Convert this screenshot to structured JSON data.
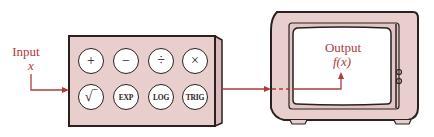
{
  "diagram": {
    "colors": {
      "box_fill": "#e8cfcd",
      "outline": "#2a2020",
      "arrow": "#b03a3a",
      "label": "#b03a3a",
      "screen": "#ffffff"
    },
    "input": {
      "label": "Input",
      "variable": "x"
    },
    "calculator": {
      "buttons": [
        {
          "label": "+",
          "icon": "plus-icon"
        },
        {
          "label": "−",
          "icon": "minus-icon"
        },
        {
          "label": "÷",
          "icon": "divide-icon"
        },
        {
          "label": "×",
          "icon": "multiply-icon"
        },
        {
          "label": "√‾",
          "icon": "square-root-icon"
        },
        {
          "label": "EXP"
        },
        {
          "label": "LOG"
        },
        {
          "label": "TRIG"
        }
      ]
    },
    "output": {
      "label": "Output",
      "function": "f(x)"
    }
  }
}
